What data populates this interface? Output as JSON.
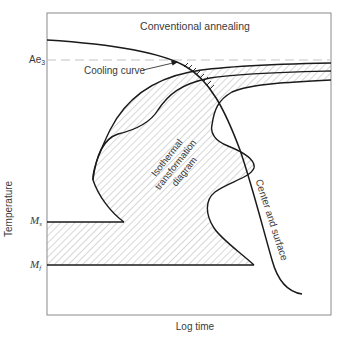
{
  "diagram": {
    "title": "Conventional annealing",
    "x_axis_label": "Log time",
    "y_axis_label": "Temperature",
    "y_markers": [
      {
        "id": "ae3",
        "base": "Ae",
        "subscript": "3",
        "style": "dashed"
      },
      {
        "id": "ms",
        "base": "M",
        "subscript": "s",
        "style": "solid"
      },
      {
        "id": "mf",
        "base": "M",
        "subscript": "f",
        "style": "solid"
      }
    ],
    "annotations": {
      "cooling_curve": "Cooling curve",
      "ttt_diagram_line1": "Isothermal",
      "ttt_diagram_line2": "transformation",
      "ttt_diagram_line3": "diagram",
      "center_surface": "Center and surface"
    },
    "colors": {
      "line": "#1a1a1a",
      "frame": "#8a8a8a",
      "dashed": "#bdbdbd",
      "hatch": "#9a9a9a",
      "text": "#3a3a3a"
    }
  }
}
